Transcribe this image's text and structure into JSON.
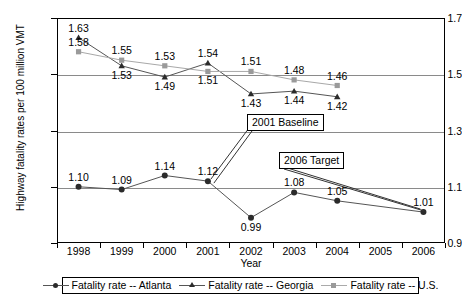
{
  "chart_data": {
    "type": "line",
    "title": "",
    "xlabel": "Year",
    "ylabel": "Highway fatality rates per 100 million VMT",
    "categories": [
      "1998",
      "1999",
      "2000",
      "2001",
      "2002",
      "2003",
      "2004",
      "2005",
      "2006"
    ],
    "x": [
      1998,
      1999,
      2000,
      2001,
      2002,
      2003,
      2004,
      2005,
      2006
    ],
    "ylim": [
      0.9,
      1.7
    ],
    "yticks": [
      "0.9",
      "1.1",
      "1.3",
      "1.5",
      "1.7"
    ],
    "grid": true,
    "legend_position": "bottom",
    "series": [
      {
        "name": "Fatality rate -- Atlanta",
        "marker": "circle",
        "color": "#2b2b2b",
        "points": [
          {
            "x": "1998",
            "y": 1.1,
            "label": "1.10"
          },
          {
            "x": "1999",
            "y": 1.09,
            "label": "1.09"
          },
          {
            "x": "2000",
            "y": 1.14,
            "label": "1.14"
          },
          {
            "x": "2001",
            "y": 1.12,
            "label": "1.12"
          },
          {
            "x": "2002",
            "y": 0.99,
            "label": "0.99"
          },
          {
            "x": "2003",
            "y": 1.08,
            "label": "1.08"
          },
          {
            "x": "2004",
            "y": 1.05,
            "label": "1.05"
          },
          {
            "x": "2006",
            "y": 1.01,
            "label": "1.01"
          }
        ]
      },
      {
        "name": "Fatality rate -- Georgia",
        "marker": "triangle",
        "color": "#2b2b2b",
        "points": [
          {
            "x": "1998",
            "y": 1.63,
            "label": "1.63"
          },
          {
            "x": "1999",
            "y": 1.53,
            "label": "1.53"
          },
          {
            "x": "2000",
            "y": 1.49,
            "label": "1.49"
          },
          {
            "x": "2001",
            "y": 1.54,
            "label": "1.54"
          },
          {
            "x": "2002",
            "y": 1.43,
            "label": "1.43"
          },
          {
            "x": "2003",
            "y": 1.44,
            "label": "1.44"
          },
          {
            "x": "2004",
            "y": 1.42,
            "label": "1.42"
          }
        ]
      },
      {
        "name": "Fatality rate -- U.S.",
        "marker": "square",
        "color": "#9a9a9a",
        "points": [
          {
            "x": "1998",
            "y": 1.58,
            "label": "1.58"
          },
          {
            "x": "1999",
            "y": 1.55,
            "label": "1.55"
          },
          {
            "x": "2000",
            "y": 1.53,
            "label": "1.53"
          },
          {
            "x": "2001",
            "y": 1.51,
            "label": "1.51"
          },
          {
            "x": "2002",
            "y": 1.51,
            "label": "1.51"
          },
          {
            "x": "2003",
            "y": 1.48,
            "label": "1.48"
          },
          {
            "x": "2004",
            "y": 1.46,
            "label": "1.46"
          }
        ]
      }
    ],
    "annotations": [
      {
        "text": "2001 Baseline",
        "target_x": "2001",
        "target_y": 1.12
      },
      {
        "text": "2006 Target",
        "target_x": "2006",
        "target_y": 1.01
      }
    ]
  },
  "labels": {
    "y_axis_title": "Highway fatality rates per 100 million VMT",
    "x_axis_title": "Year",
    "callout_baseline": "2001 Baseline",
    "callout_target": "2006 Target",
    "legend_atlanta": "Fatality rate -- Atlanta",
    "legend_georgia": "Fatality rate -- Georgia",
    "legend_us": "Fatality rate -- U.S."
  }
}
